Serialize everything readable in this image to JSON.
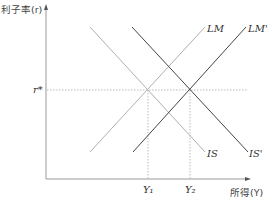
{
  "diagram": {
    "type": "IS-LM",
    "y_axis_label": "利子率(r)",
    "x_axis_label": "所得(Y)",
    "r_star_label": "r*",
    "y1_label": "Y₁",
    "y2_label": "Y₂",
    "curves": [
      {
        "name": "LM",
        "label": "LM",
        "color": "#b0b0b0"
      },
      {
        "name": "LM'",
        "label": "LM'",
        "color": "#444444"
      },
      {
        "name": "IS",
        "label": "IS",
        "color": "#b0b0b0"
      },
      {
        "name": "IS'",
        "label": "IS'",
        "color": "#444444"
      }
    ],
    "colors": {
      "axis": "#999999",
      "guide": "#aaaaaa",
      "light_curve": "#b0b0b0",
      "dark_curve": "#444444"
    }
  }
}
